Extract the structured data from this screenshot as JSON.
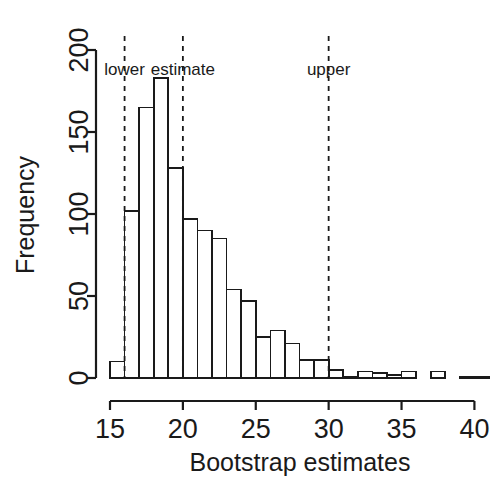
{
  "chart_data": {
    "type": "bar",
    "title": "",
    "subtitle": "",
    "xlabel": "Bootstrap estimates",
    "ylabel": "Frequency",
    "xlim": [
      15,
      41
    ],
    "ylim": [
      0,
      200
    ],
    "xticks": [
      15,
      20,
      25,
      30,
      35,
      40
    ],
    "xtick_labels": [
      "15",
      "20",
      "25",
      "30",
      "35",
      "40"
    ],
    "yticks": [
      0,
      50,
      100,
      150,
      200
    ],
    "ytick_labels": [
      "0",
      "50",
      "100",
      "150",
      "200"
    ],
    "grid": false,
    "legend": "none",
    "bin_width": 1,
    "bin_edges": [
      15,
      16,
      17,
      18,
      19,
      20,
      21,
      22,
      23,
      24,
      25,
      26,
      27,
      28,
      29,
      30,
      31,
      32,
      33,
      34,
      35,
      36,
      37,
      38,
      39,
      40,
      41
    ],
    "categories": [
      "15-16",
      "16-17",
      "17-18",
      "18-19",
      "19-20",
      "20-21",
      "21-22",
      "22-23",
      "23-24",
      "24-25",
      "25-26",
      "26-27",
      "27-28",
      "28-29",
      "29-30",
      "30-31",
      "31-32",
      "32-33",
      "33-34",
      "34-35",
      "35-36",
      "36-37",
      "37-38",
      "38-39",
      "39-40",
      "40-41"
    ],
    "values": [
      10,
      102,
      165,
      183,
      128,
      97,
      90,
      85,
      54,
      47,
      25,
      29,
      21,
      11,
      11,
      5,
      1,
      4,
      3,
      2,
      4,
      0,
      4,
      0,
      1,
      1
    ],
    "annotations": [
      {
        "label": "lower",
        "x": 16,
        "type": "vline",
        "style": "dashed"
      },
      {
        "label": "estimate",
        "x": 20,
        "type": "vline",
        "style": "dashed"
      },
      {
        "label": "upper",
        "x": 30,
        "type": "vline",
        "style": "dashed"
      }
    ],
    "colors": {
      "bar_fill": "#ffffff",
      "bar_stroke": "#1a1a1a",
      "axis": "#1a1a1a",
      "reference_line": "#1a1a1a",
      "background": "#ffffff"
    }
  }
}
